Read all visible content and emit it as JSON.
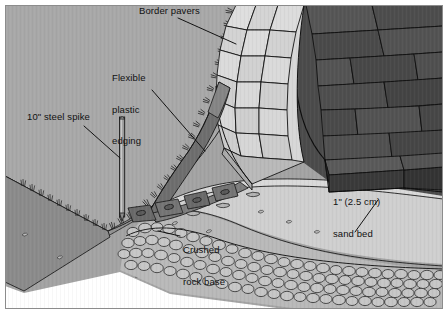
{
  "figure": {
    "kind": "cross-section-illustration",
    "width": 448,
    "height": 314
  },
  "labels": {
    "border_pavers": "Border pavers",
    "flexible_edging_line1": "Flexible",
    "flexible_edging_line2": "plastic",
    "flexible_edging_line3": "edging",
    "steel_spike": "10\" steel spike",
    "sand_bed_line1": "1\" (2.5 cm)",
    "sand_bed_line2": "sand bed",
    "crushed_rock_line1": "Crushed",
    "crushed_rock_line2": "rock base"
  },
  "colors": {
    "page_background": "#ffffff",
    "lawn_surface": "#a3a3a3",
    "lawn_soil_face": "#8f8f8f",
    "border_paver_top": "#dcdcdc",
    "border_paver_face": "#b8b8b8",
    "field_paver_top": "#4e4e4e",
    "field_paver_face": "#3a3a3a",
    "sand_bed": "#cfcfcf",
    "sand_bed_face": "#c2c2c2",
    "crushed_rock": "#bdbdbd",
    "crushed_rock_stone": "#c9c9c9",
    "edging_plastic": "#6d6d6d",
    "edging_flange": "#7a7a7a",
    "steel_spike": "#8a8a8a",
    "outline": "#111111",
    "label_text": "#111111"
  },
  "layers": [
    {
      "name": "border-pavers",
      "label": "Border pavers",
      "tone": "light-gray"
    },
    {
      "name": "field-pavers",
      "label": "Field pavers",
      "tone": "dark-gray"
    },
    {
      "name": "flexible-plastic-edging",
      "label": "Flexible plastic edging",
      "tone": "mid-gray"
    },
    {
      "name": "steel-spike",
      "label": "10\" steel spike",
      "tone": "mid-gray"
    },
    {
      "name": "sand-bed",
      "label": "1\" (2.5 cm) sand bed",
      "tone": "light-gray"
    },
    {
      "name": "crushed-rock-base",
      "label": "Crushed rock base",
      "tone": "cobbled-gray"
    },
    {
      "name": "lawn-turf",
      "label": "Lawn / turf",
      "tone": "mid-gray"
    }
  ],
  "leaders": [
    {
      "from": "border_pavers",
      "to": "border-pavers"
    },
    {
      "from": "flexible_edging",
      "to": "flexible-plastic-edging"
    },
    {
      "from": "steel_spike",
      "to": "steel-spike"
    },
    {
      "from": "sand_bed",
      "to": "sand-bed"
    },
    {
      "from": "crushed_rock",
      "to": "crushed-rock-base"
    }
  ]
}
